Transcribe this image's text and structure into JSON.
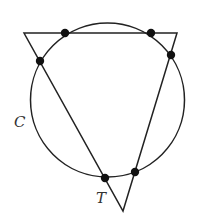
{
  "diagram": {
    "colors": {
      "stroke": "#222222",
      "point": "#111111",
      "label": "#333333",
      "background": "#ffffff"
    },
    "circle": {
      "label": "C",
      "cx": 107.5,
      "cy": 100,
      "r": 77,
      "label_x": 14,
      "label_y": 127
    },
    "triangle": {
      "label": "T",
      "vertices": [
        {
          "x": 24,
          "y": 33
        },
        {
          "x": 177,
          "y": 33
        },
        {
          "x": 123,
          "y": 211
        }
      ],
      "label_x": 96,
      "label_y": 203
    },
    "intersection_points": [
      {
        "x": 65,
        "y": 33
      },
      {
        "x": 151,
        "y": 33
      },
      {
        "x": 40,
        "y": 61
      },
      {
        "x": 171,
        "y": 55
      },
      {
        "x": 105,
        "y": 178
      },
      {
        "x": 135,
        "y": 172
      }
    ]
  }
}
